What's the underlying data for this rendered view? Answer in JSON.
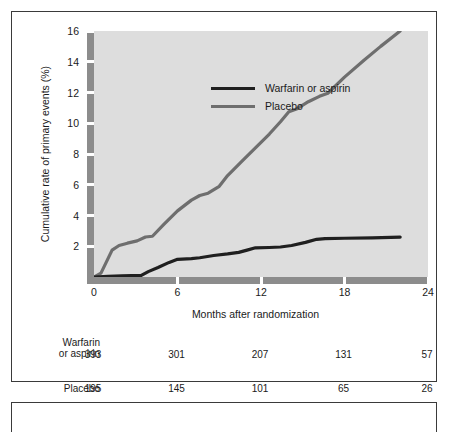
{
  "chart_data": {
    "type": "line",
    "title": "",
    "xlabel": "Months after randomization",
    "ylabel": "Cumulative rate of primary events (%)",
    "xlim": [
      0,
      24
    ],
    "ylim": [
      0,
      16
    ],
    "xticks": [
      "0",
      "6",
      "12",
      "18",
      "24"
    ],
    "xtick_values": [
      0,
      6,
      12,
      18,
      24
    ],
    "yticks": [
      "2",
      "4",
      "6",
      "8",
      "10",
      "12",
      "14",
      "16"
    ],
    "ytick_values": [
      2,
      4,
      6,
      8,
      10,
      12,
      14,
      16
    ],
    "grid": false,
    "legend_position": "top-left",
    "series": [
      {
        "name": "Warfarin or aspirin",
        "color": "#1f1f1f",
        "x": [
          0,
          1.0,
          2.0,
          3.4,
          3.9,
          4.6,
          5.4,
          6.0,
          7.0,
          7.6,
          8.6,
          9.6,
          10.4,
          11.0,
          11.6,
          12.6,
          13.4,
          14.2,
          15.2,
          16.0,
          16.6,
          18.0,
          20.0,
          22.0
        ],
        "y": [
          0.0,
          0.05,
          0.07,
          0.1,
          0.35,
          0.62,
          0.95,
          1.15,
          1.2,
          1.25,
          1.4,
          1.5,
          1.6,
          1.75,
          1.9,
          1.92,
          1.95,
          2.05,
          2.25,
          2.45,
          2.5,
          2.52,
          2.55,
          2.6
        ]
      },
      {
        "name": "Placebo",
        "color": "#6e6e6e",
        "x": [
          0,
          0.5,
          0.9,
          1.3,
          1.8,
          2.4,
          3.1,
          3.7,
          4.2,
          5.0,
          6.0,
          7.0,
          7.6,
          8.2,
          9.0,
          9.6,
          10.6,
          11.6,
          12.6,
          13.4,
          14.0,
          14.6,
          15.4,
          16.2,
          16.8,
          18.0,
          19.4,
          20.6,
          22.0
        ],
        "y": [
          0.0,
          0.25,
          1.0,
          1.75,
          2.05,
          2.2,
          2.35,
          2.6,
          2.65,
          3.4,
          4.3,
          5.0,
          5.3,
          5.45,
          5.9,
          6.6,
          7.5,
          8.4,
          9.3,
          10.1,
          10.75,
          10.95,
          11.4,
          11.75,
          11.95,
          13.0,
          14.1,
          15.0,
          16.0
        ]
      }
    ]
  },
  "legend": {
    "items": [
      {
        "label": "Warfarin or aspirin",
        "color": "#1f1f1f"
      },
      {
        "label": "Placebo",
        "color": "#6e6e6e"
      }
    ]
  },
  "risk_table": {
    "rows": [
      {
        "label_line1": "Warfarin",
        "label_line2": "or aspirin",
        "values": [
          "393",
          "301",
          "207",
          "131",
          "57"
        ]
      },
      {
        "label_line1": "",
        "label_line2": "Placebo",
        "values": [
          "195",
          "145",
          "101",
          "65",
          "26"
        ]
      }
    ]
  },
  "colors": {
    "plot_background": "#dddddd",
    "axis_bar": "#8c8c8c",
    "frame_border": "#3a3a3a",
    "page_background": "#ffffff",
    "text": "#1a1a1a"
  }
}
